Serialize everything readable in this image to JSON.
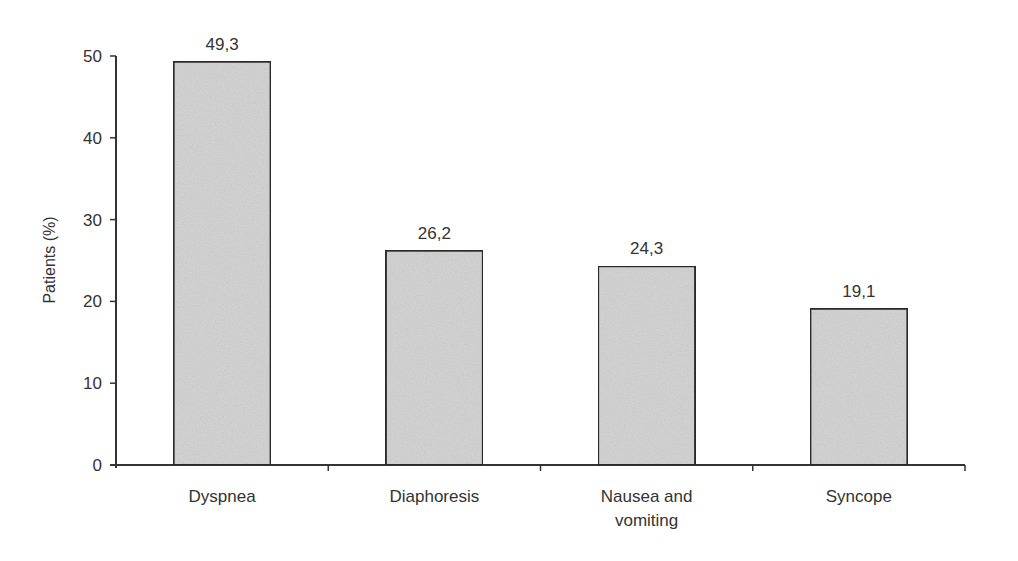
{
  "chart_data": {
    "type": "bar",
    "title": "",
    "xlabel": "",
    "ylabel": "Patients (%)",
    "ylim": [
      0,
      50
    ],
    "yticks": [
      0,
      10,
      20,
      30,
      40,
      50
    ],
    "grid": false,
    "legend": null,
    "categories": [
      "Dyspnea",
      "Diaphoresis",
      "Nausea and vomiting",
      "Syncope"
    ],
    "category_lines": [
      [
        "Dyspnea"
      ],
      [
        "Diaphoresis"
      ],
      [
        "Nausea and",
        "vomiting"
      ],
      [
        "Syncope"
      ]
    ],
    "values": [
      49.3,
      26.2,
      24.3,
      19.1
    ],
    "value_labels": [
      "49,3",
      "26,2",
      "24,3",
      "19,1"
    ],
    "bar_color": "#d4d4d4",
    "bar_edge_color": "#2b2b2b"
  }
}
